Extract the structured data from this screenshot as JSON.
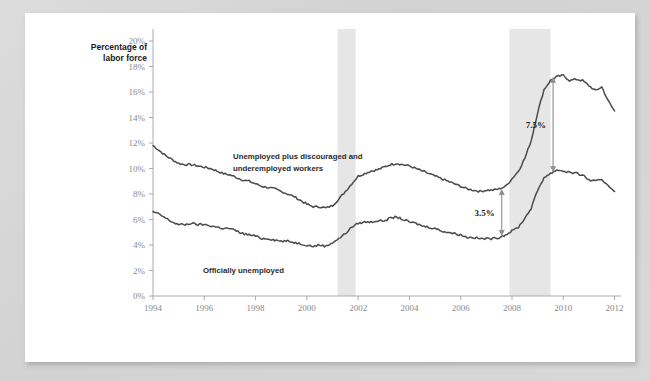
{
  "figure": {
    "axis_title_line1": "Percentage of",
    "axis_title_line2": "labor force"
  },
  "chart_data": {
    "type": "line",
    "title": "",
    "subtitle": "",
    "xlabel": "",
    "ylabel": "Percentage of labor force",
    "xlim": [
      1994,
      2012.25
    ],
    "ylim": [
      0,
      20
    ],
    "grid": false,
    "legend_position": "inline-annotation",
    "xticks": [
      "1994",
      "1996",
      "1998",
      "2000",
      "2002",
      "2004",
      "2006",
      "2008",
      "2010",
      "2012"
    ],
    "xtick_values": [
      1994,
      1996,
      1998,
      2000,
      2002,
      2004,
      2006,
      2008,
      2010,
      2012
    ],
    "yticks": [
      "0%",
      "2%",
      "4%",
      "6%",
      "8%",
      "10%",
      "12%",
      "14%",
      "16%",
      "18%",
      "20%"
    ],
    "ytick_values": [
      0,
      2,
      4,
      6,
      8,
      10,
      12,
      14,
      16,
      18,
      20
    ],
    "series": [
      {
        "name": "Unemployed plus discouraged and underemployed workers",
        "label_line1": "Unemployed plus discouraged and",
        "label_line2": "underemployed workers",
        "color": "#4a4a4a",
        "x": [
          1994.0,
          1994.25,
          1994.5,
          1994.75,
          1995.0,
          1995.25,
          1995.5,
          1995.75,
          1996.0,
          1996.25,
          1996.5,
          1996.75,
          1997.0,
          1997.25,
          1997.5,
          1997.75,
          1998.0,
          1998.25,
          1998.5,
          1998.75,
          1999.0,
          1999.25,
          1999.5,
          1999.75,
          2000.0,
          2000.25,
          2000.5,
          2000.75,
          2001.0,
          2001.25,
          2001.5,
          2001.75,
          2002.0,
          2002.25,
          2002.5,
          2002.75,
          2003.0,
          2003.25,
          2003.5,
          2003.75,
          2004.0,
          2004.25,
          2004.5,
          2004.75,
          2005.0,
          2005.25,
          2005.5,
          2005.75,
          2006.0,
          2006.25,
          2006.5,
          2006.75,
          2007.0,
          2007.25,
          2007.5,
          2007.75,
          2008.0,
          2008.25,
          2008.5,
          2008.75,
          2009.0,
          2009.25,
          2009.5,
          2009.75,
          2010.0,
          2010.25,
          2010.5,
          2010.75,
          2011.0,
          2011.25,
          2011.5,
          2011.75,
          2012.0
        ],
        "y": [
          11.8,
          11.4,
          11.0,
          10.7,
          10.4,
          10.3,
          10.3,
          10.2,
          10.1,
          10.0,
          9.8,
          9.6,
          9.5,
          9.3,
          9.1,
          9.0,
          8.8,
          8.6,
          8.5,
          8.4,
          8.2,
          8.0,
          7.8,
          7.5,
          7.2,
          7.0,
          7.0,
          6.9,
          7.1,
          7.6,
          8.2,
          8.8,
          9.4,
          9.6,
          9.8,
          9.9,
          10.1,
          10.3,
          10.4,
          10.3,
          10.2,
          10.0,
          9.8,
          9.6,
          9.4,
          9.2,
          9.0,
          8.8,
          8.6,
          8.4,
          8.3,
          8.2,
          8.3,
          8.3,
          8.4,
          8.6,
          9.2,
          9.8,
          10.8,
          12.2,
          14.4,
          16.2,
          16.9,
          17.2,
          17.3,
          16.9,
          17.0,
          16.9,
          16.5,
          16.1,
          16.4,
          15.3,
          14.5
        ]
      },
      {
        "name": "Officially unemployed",
        "label_line1": "Officially unemployed",
        "label_line2": "",
        "color": "#4a4a4a",
        "x": [
          1994.0,
          1994.25,
          1994.5,
          1994.75,
          1995.0,
          1995.25,
          1995.5,
          1995.75,
          1996.0,
          1996.25,
          1996.5,
          1996.75,
          1997.0,
          1997.25,
          1997.5,
          1997.75,
          1998.0,
          1998.25,
          1998.5,
          1998.75,
          1999.0,
          1999.25,
          1999.5,
          1999.75,
          2000.0,
          2000.25,
          2000.5,
          2000.75,
          2001.0,
          2001.25,
          2001.5,
          2001.75,
          2002.0,
          2002.25,
          2002.5,
          2002.75,
          2003.0,
          2003.25,
          2003.5,
          2003.75,
          2004.0,
          2004.25,
          2004.5,
          2004.75,
          2005.0,
          2005.25,
          2005.5,
          2005.75,
          2006.0,
          2006.25,
          2006.5,
          2006.75,
          2007.0,
          2007.25,
          2007.5,
          2007.75,
          2008.0,
          2008.25,
          2008.5,
          2008.75,
          2009.0,
          2009.25,
          2009.5,
          2009.75,
          2010.0,
          2010.25,
          2010.5,
          2010.75,
          2011.0,
          2011.25,
          2011.5,
          2011.75,
          2012.0
        ],
        "y": [
          6.6,
          6.4,
          6.1,
          5.8,
          5.6,
          5.6,
          5.7,
          5.6,
          5.6,
          5.5,
          5.4,
          5.3,
          5.3,
          5.1,
          4.9,
          4.8,
          4.7,
          4.5,
          4.5,
          4.4,
          4.3,
          4.3,
          4.2,
          4.1,
          4.0,
          3.9,
          4.0,
          3.9,
          4.2,
          4.5,
          4.9,
          5.4,
          5.7,
          5.8,
          5.8,
          5.9,
          5.9,
          6.1,
          6.2,
          6.0,
          5.8,
          5.7,
          5.5,
          5.4,
          5.3,
          5.1,
          5.0,
          4.9,
          4.8,
          4.6,
          4.6,
          4.5,
          4.5,
          4.5,
          4.6,
          4.8,
          5.1,
          5.4,
          6.1,
          6.9,
          8.3,
          9.3,
          9.6,
          9.9,
          9.8,
          9.7,
          9.6,
          9.5,
          9.1,
          9.0,
          9.1,
          8.7,
          8.2
        ]
      }
    ],
    "annotations": [
      {
        "id": "gap-2007",
        "label": "3.5%",
        "x": 2007.6,
        "y_top": 8.4,
        "y_bottom": 4.7
      },
      {
        "id": "gap-2009",
        "label": "7.5%",
        "x": 2009.6,
        "y_top": 17.2,
        "y_bottom": 9.7
      }
    ],
    "shaded_bands": [
      {
        "id": "recession-2001",
        "label": "",
        "x_start": 2001.2,
        "x_end": 2001.9,
        "color": "#e6e6e6"
      },
      {
        "id": "recession-2008",
        "label": "",
        "x_start": 2007.9,
        "x_end": 2009.5,
        "color": "#e6e6e6"
      }
    ]
  }
}
